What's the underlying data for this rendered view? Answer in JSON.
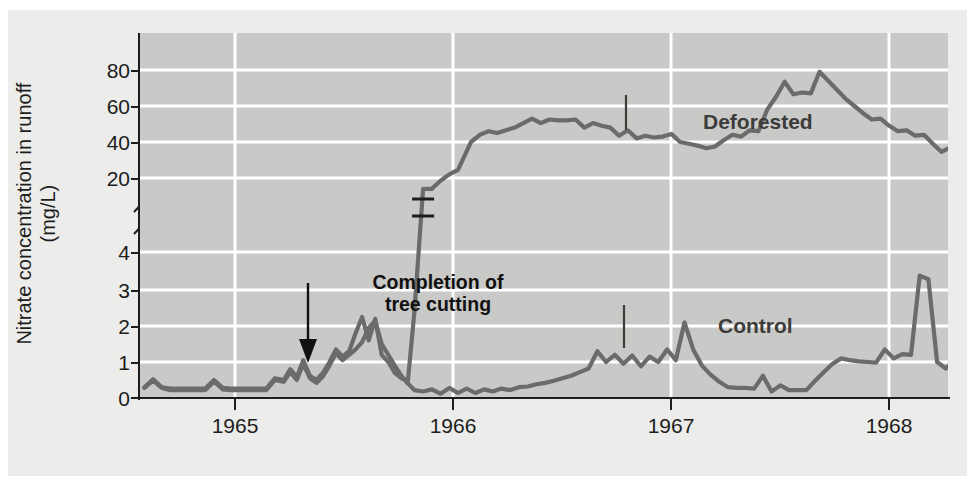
{
  "figure": {
    "y_axis_title_line1": "Nitrate concentration in runoff",
    "y_axis_title_line2": "(mg/L)",
    "background_color": "#ececeb",
    "plot_color": "#c9c9c7",
    "line_color": "#6b6b6b",
    "gridline_color": "#ffffff",
    "axis_color": "#1d1d1b"
  },
  "annotations": {
    "completion_line1": "Completion of",
    "completion_line2": "tree cutting",
    "deforested_label": "Deforested",
    "control_label": "Control"
  },
  "chart_data": {
    "type": "line",
    "title": "",
    "xlabel": "",
    "ylabel": "Nitrate concentration in runoff (mg/L)",
    "x_tick_labels": [
      "1965",
      "1966",
      "1967",
      "1968"
    ],
    "x_tick_positions_year": [
      1965.0,
      1966.0,
      1967.0,
      1968.0
    ],
    "xlim": [
      1964.62,
      1968.33
    ],
    "y_axis_broken": true,
    "y_lower_segment": {
      "ticks": [
        0,
        1,
        2,
        3,
        4
      ],
      "range": [
        0,
        4.6
      ]
    },
    "y_upper_segment": {
      "ticks": [
        20,
        40,
        60,
        80
      ],
      "range": [
        14,
        88
      ]
    },
    "y_tick_labels": [
      "0",
      "1",
      "2",
      "3",
      "4",
      "20",
      "40",
      "60",
      "80"
    ],
    "gridlines_y": [
      1,
      2,
      3,
      4,
      20,
      40,
      60,
      80
    ],
    "legend_position": "inline-labels",
    "annotation_events": [
      {
        "label": "Completion of tree cutting",
        "x_year": 1965.37,
        "y_value": 1.05
      }
    ],
    "series": [
      {
        "name": "Deforested",
        "color": "#6b6b6b",
        "has_axis_break_marker": true,
        "axis_break_x_year": 1966.1,
        "points": [
          [
            1964.64,
            0.3
          ],
          [
            1964.68,
            0.52
          ],
          [
            1964.72,
            0.3
          ],
          [
            1964.76,
            0.26
          ],
          [
            1964.8,
            0.26
          ],
          [
            1964.84,
            0.26
          ],
          [
            1964.88,
            0.26
          ],
          [
            1964.92,
            0.26
          ],
          [
            1964.96,
            0.5
          ],
          [
            1965.0,
            0.28
          ],
          [
            1965.04,
            0.26
          ],
          [
            1965.08,
            0.26
          ],
          [
            1965.12,
            0.26
          ],
          [
            1965.16,
            0.26
          ],
          [
            1965.2,
            0.26
          ],
          [
            1965.24,
            0.55
          ],
          [
            1965.28,
            0.5
          ],
          [
            1965.31,
            0.8
          ],
          [
            1965.34,
            0.58
          ],
          [
            1965.37,
            1.05
          ],
          [
            1965.4,
            0.62
          ],
          [
            1965.43,
            0.5
          ],
          [
            1965.46,
            0.7
          ],
          [
            1965.49,
            1.0
          ],
          [
            1965.52,
            1.35
          ],
          [
            1965.55,
            1.15
          ],
          [
            1965.58,
            1.3
          ],
          [
            1965.61,
            1.8
          ],
          [
            1965.64,
            2.25
          ],
          [
            1965.67,
            1.6
          ],
          [
            1965.7,
            2.2
          ],
          [
            1965.73,
            1.2
          ],
          [
            1965.76,
            1.0
          ],
          [
            1965.79,
            0.7
          ],
          [
            1965.82,
            0.55
          ],
          [
            1965.85,
            0.48
          ],
          [
            1965.88,
            2.4
          ],
          [
            1965.92,
            8.0
          ],
          [
            1965.96,
            14.0
          ],
          [
            1966.0,
            18.5
          ],
          [
            1966.04,
            22.0
          ],
          [
            1966.08,
            24.5
          ],
          [
            1966.14,
            40.0
          ],
          [
            1966.18,
            44.0
          ],
          [
            1966.22,
            46.0
          ],
          [
            1966.26,
            45.0
          ],
          [
            1966.3,
            46.5
          ],
          [
            1966.34,
            48.0
          ],
          [
            1966.38,
            50.5
          ],
          [
            1966.42,
            53.0
          ],
          [
            1966.46,
            50.5
          ],
          [
            1966.5,
            52.5
          ],
          [
            1966.54,
            52.0
          ],
          [
            1966.58,
            52.0
          ],
          [
            1966.62,
            52.5
          ],
          [
            1966.66,
            48.0
          ],
          [
            1966.7,
            50.5
          ],
          [
            1966.74,
            49.0
          ],
          [
            1966.78,
            48.0
          ],
          [
            1966.82,
            43.5
          ],
          [
            1966.86,
            46.5
          ],
          [
            1966.9,
            42.0
          ],
          [
            1966.94,
            43.5
          ],
          [
            1966.98,
            42.5
          ],
          [
            1967.02,
            43.0
          ],
          [
            1967.06,
            44.5
          ],
          [
            1967.1,
            40.0
          ],
          [
            1967.14,
            39.0
          ],
          [
            1967.18,
            38.0
          ],
          [
            1967.22,
            36.5
          ],
          [
            1967.26,
            37.5
          ],
          [
            1967.3,
            41.0
          ],
          [
            1967.34,
            44.0
          ],
          [
            1967.38,
            43.0
          ],
          [
            1967.42,
            46.5
          ],
          [
            1967.46,
            46.0
          ],
          [
            1967.5,
            58.0
          ],
          [
            1967.54,
            65.0
          ],
          [
            1967.58,
            73.5
          ],
          [
            1967.62,
            66.5
          ],
          [
            1967.66,
            67.5
          ],
          [
            1967.7,
            67.0
          ],
          [
            1967.74,
            79.0
          ],
          [
            1967.78,
            74.0
          ],
          [
            1967.82,
            69.0
          ],
          [
            1967.86,
            64.0
          ],
          [
            1967.9,
            60.0
          ],
          [
            1967.94,
            56.0
          ],
          [
            1967.98,
            52.5
          ],
          [
            1968.02,
            53.0
          ],
          [
            1968.06,
            49.0
          ],
          [
            1968.1,
            46.0
          ],
          [
            1968.14,
            46.5
          ],
          [
            1968.18,
            43.5
          ],
          [
            1968.22,
            44.0
          ],
          [
            1968.26,
            39.0
          ],
          [
            1968.3,
            34.5
          ],
          [
            1968.34,
            37.0
          ],
          [
            1968.38,
            35.0
          ],
          [
            1968.42,
            38.0
          ],
          [
            1968.46,
            34.5
          ],
          [
            1968.5,
            36.0
          ]
        ]
      },
      {
        "name": "Control",
        "color": "#6b6b6b",
        "points": [
          [
            1964.64,
            0.28
          ],
          [
            1964.68,
            0.48
          ],
          [
            1964.72,
            0.28
          ],
          [
            1964.76,
            0.22
          ],
          [
            1964.8,
            0.22
          ],
          [
            1964.84,
            0.22
          ],
          [
            1964.88,
            0.22
          ],
          [
            1964.92,
            0.22
          ],
          [
            1964.96,
            0.46
          ],
          [
            1965.0,
            0.24
          ],
          [
            1965.04,
            0.22
          ],
          [
            1965.08,
            0.22
          ],
          [
            1965.12,
            0.22
          ],
          [
            1965.16,
            0.22
          ],
          [
            1965.2,
            0.22
          ],
          [
            1965.24,
            0.5
          ],
          [
            1965.28,
            0.45
          ],
          [
            1965.31,
            0.72
          ],
          [
            1965.34,
            0.5
          ],
          [
            1965.37,
            0.95
          ],
          [
            1965.4,
            0.55
          ],
          [
            1965.43,
            0.42
          ],
          [
            1965.46,
            0.6
          ],
          [
            1965.49,
            0.9
          ],
          [
            1965.52,
            1.25
          ],
          [
            1965.55,
            1.05
          ],
          [
            1965.58,
            1.2
          ],
          [
            1965.61,
            1.35
          ],
          [
            1965.64,
            1.55
          ],
          [
            1965.67,
            1.95
          ],
          [
            1965.7,
            2.15
          ],
          [
            1965.73,
            1.5
          ],
          [
            1965.76,
            1.2
          ],
          [
            1965.79,
            0.9
          ],
          [
            1965.82,
            0.62
          ],
          [
            1965.85,
            0.4
          ],
          [
            1965.88,
            0.22
          ],
          [
            1965.92,
            0.18
          ],
          [
            1965.96,
            0.24
          ],
          [
            1966.0,
            0.12
          ],
          [
            1966.04,
            0.28
          ],
          [
            1966.08,
            0.14
          ],
          [
            1966.12,
            0.26
          ],
          [
            1966.16,
            0.14
          ],
          [
            1966.2,
            0.24
          ],
          [
            1966.24,
            0.18
          ],
          [
            1966.28,
            0.26
          ],
          [
            1966.32,
            0.22
          ],
          [
            1966.36,
            0.3
          ],
          [
            1966.4,
            0.32
          ],
          [
            1966.44,
            0.38
          ],
          [
            1966.48,
            0.42
          ],
          [
            1966.52,
            0.48
          ],
          [
            1966.56,
            0.55
          ],
          [
            1966.6,
            0.62
          ],
          [
            1966.64,
            0.72
          ],
          [
            1966.68,
            0.82
          ],
          [
            1966.72,
            1.3
          ],
          [
            1966.76,
            1.0
          ],
          [
            1966.8,
            1.2
          ],
          [
            1966.84,
            0.95
          ],
          [
            1966.88,
            1.18
          ],
          [
            1966.92,
            0.88
          ],
          [
            1966.96,
            1.15
          ],
          [
            1967.0,
            1.0
          ],
          [
            1967.04,
            1.35
          ],
          [
            1967.08,
            1.05
          ],
          [
            1967.12,
            2.1
          ],
          [
            1967.16,
            1.35
          ],
          [
            1967.2,
            0.9
          ],
          [
            1967.24,
            0.65
          ],
          [
            1967.28,
            0.45
          ],
          [
            1967.32,
            0.3
          ],
          [
            1967.36,
            0.28
          ],
          [
            1967.4,
            0.28
          ],
          [
            1967.44,
            0.26
          ],
          [
            1967.48,
            0.62
          ],
          [
            1967.52,
            0.18
          ],
          [
            1967.56,
            0.35
          ],
          [
            1967.6,
            0.22
          ],
          [
            1967.64,
            0.22
          ],
          [
            1967.68,
            0.22
          ],
          [
            1967.72,
            0.48
          ],
          [
            1967.76,
            0.72
          ],
          [
            1967.8,
            0.95
          ],
          [
            1967.84,
            1.1
          ],
          [
            1967.88,
            1.05
          ],
          [
            1967.92,
            1.02
          ],
          [
            1967.96,
            1.0
          ],
          [
            1968.0,
            0.98
          ],
          [
            1968.04,
            1.35
          ],
          [
            1968.08,
            1.1
          ],
          [
            1968.12,
            1.22
          ],
          [
            1968.16,
            1.2
          ],
          [
            1968.2,
            3.4
          ],
          [
            1968.24,
            3.3
          ],
          [
            1968.28,
            1.0
          ],
          [
            1968.32,
            0.82
          ],
          [
            1968.36,
            1.05
          ],
          [
            1968.4,
            0.62
          ],
          [
            1968.44,
            0.95
          ]
        ]
      }
    ]
  }
}
